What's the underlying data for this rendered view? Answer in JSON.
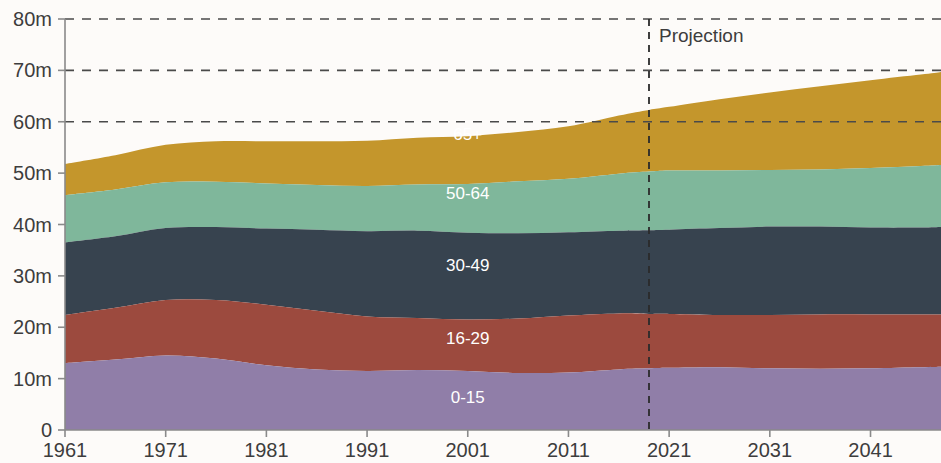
{
  "chart_data": {
    "type": "area",
    "stacked": true,
    "title": "",
    "subtitle": "",
    "xlabel": "",
    "ylabel": "",
    "xlim": [
      1961,
      2048
    ],
    "ylim": [
      0,
      80
    ],
    "grid": "horizontal-dashed",
    "legend_position": "inline-series-labels",
    "y_ticks": [
      {
        "value": 0,
        "label": "0"
      },
      {
        "value": 10,
        "label": "10m"
      },
      {
        "value": 20,
        "label": "20m"
      },
      {
        "value": 30,
        "label": "30m"
      },
      {
        "value": 40,
        "label": "40m"
      },
      {
        "value": 50,
        "label": "50m"
      },
      {
        "value": 60,
        "label": "60m"
      },
      {
        "value": 70,
        "label": "70m"
      },
      {
        "value": 80,
        "label": "80m"
      }
    ],
    "gridline_values": [
      60,
      70,
      80
    ],
    "x_ticks": [
      {
        "value": 1961,
        "label": "1961"
      },
      {
        "value": 1971,
        "label": "1971"
      },
      {
        "value": 1981,
        "label": "1981"
      },
      {
        "value": 1991,
        "label": "1991"
      },
      {
        "value": 2001,
        "label": "2001"
      },
      {
        "value": 2011,
        "label": "2011"
      },
      {
        "value": 2021,
        "label": "2021"
      },
      {
        "value": 2031,
        "label": "2031"
      },
      {
        "value": 2041,
        "label": "2041"
      }
    ],
    "x": [
      1961,
      1966,
      1971,
      1976,
      1981,
      1986,
      1991,
      1996,
      2001,
      2006,
      2011,
      2016,
      2019,
      2021,
      2026,
      2031,
      2036,
      2041,
      2046,
      2048
    ],
    "series": [
      {
        "name": "0-15",
        "label": "0-15",
        "color": "#907ea8",
        "label_x": 2001,
        "label_y": 5.3,
        "values": [
          13.0,
          13.7,
          14.5,
          13.9,
          12.6,
          11.8,
          11.5,
          11.7,
          11.5,
          11.1,
          11.2,
          11.8,
          12.0,
          12.1,
          12.2,
          12.0,
          11.9,
          12.0,
          12.2,
          12.3
        ]
      },
      {
        "name": "16-29",
        "label": "16-29",
        "color": "#9c4a3e",
        "label_x": 2001,
        "label_y": 16.8,
        "values": [
          9.4,
          10.1,
          10.8,
          11.4,
          11.8,
          11.4,
          10.6,
          10.1,
          10.0,
          10.6,
          11.1,
          10.9,
          10.6,
          10.5,
          10.2,
          10.4,
          10.6,
          10.5,
          10.3,
          10.2
        ]
      },
      {
        "name": "30-49",
        "label": "30-49",
        "color": "#37434f",
        "label_x": 2001,
        "label_y": 31.0,
        "values": [
          14.1,
          13.9,
          14.0,
          14.2,
          14.8,
          15.8,
          16.6,
          17.0,
          16.9,
          16.6,
          16.2,
          16.1,
          16.3,
          16.4,
          16.9,
          17.2,
          17.1,
          16.9,
          16.9,
          17.0
        ]
      },
      {
        "name": "50-64",
        "label": "50-64",
        "color": "#7fb79b",
        "label_x": 2001,
        "label_y": 45.0,
        "values": [
          9.2,
          9.1,
          8.9,
          8.8,
          8.8,
          8.7,
          8.8,
          9.0,
          9.5,
          10.1,
          10.4,
          11.1,
          11.4,
          11.5,
          11.2,
          11.0,
          11.1,
          11.6,
          12.0,
          12.1
        ]
      },
      {
        "name": "65+",
        "label": "65+",
        "color": "#c4962c",
        "label_x": 2001,
        "label_y": 56.5,
        "values": [
          6.1,
          6.7,
          7.3,
          7.9,
          8.2,
          8.5,
          8.8,
          9.1,
          9.3,
          9.6,
          10.2,
          11.3,
          12.0,
          12.4,
          13.9,
          15.1,
          16.2,
          17.1,
          17.8,
          18.1
        ]
      }
    ],
    "annotations": [
      {
        "name": "projection-divider",
        "label": "Projection",
        "x": 2019,
        "label_offset_x": 10,
        "label_y": 75.5,
        "line_color": "#2b2b2b"
      }
    ],
    "colors": {
      "background": "#fdfbf9",
      "axis": "#8a8a8a",
      "gridline": "#4a4a4a",
      "tick_text": "#3d3d3d",
      "series_label": "#ffffff"
    }
  }
}
